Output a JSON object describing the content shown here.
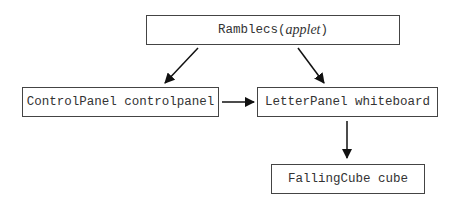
{
  "diagram": {
    "nodes": [
      {
        "id": "rambles",
        "label": "Ramblecs",
        "suffix_open": " (",
        "suffix_italic": "applet",
        "suffix_close": ")"
      },
      {
        "id": "controlpanel",
        "label": "ControlPanel controlpanel"
      },
      {
        "id": "letterpanel",
        "label": "LetterPanel whiteboard"
      },
      {
        "id": "fallingcube",
        "label": "FallingCube cube"
      }
    ],
    "edges": [
      {
        "from": "rambles",
        "to": "controlpanel"
      },
      {
        "from": "rambles",
        "to": "letterpanel"
      },
      {
        "from": "controlpanel",
        "to": "letterpanel"
      },
      {
        "from": "letterpanel",
        "to": "fallingcube"
      }
    ],
    "colors": {
      "stroke": "#444444",
      "arrow": "#111111",
      "text": "#333333"
    }
  }
}
